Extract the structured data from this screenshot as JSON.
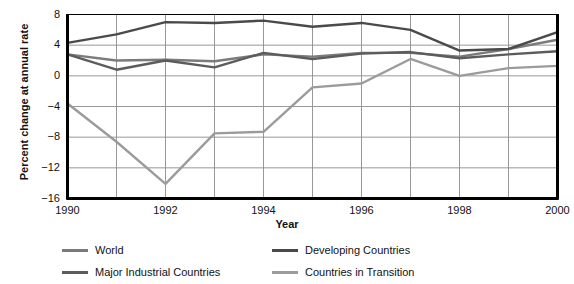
{
  "chart_data": {
    "type": "line",
    "title": "",
    "xlabel": "Year",
    "ylabel": "Percent change at annual rate",
    "x": [
      1990,
      1991,
      1992,
      1993,
      1994,
      1995,
      1996,
      1997,
      1998,
      1999,
      2000
    ],
    "xlim": [
      1990,
      2000
    ],
    "ylim": [
      -16,
      8
    ],
    "yticks": [
      8,
      4,
      0,
      -4,
      -8,
      -12,
      -16
    ],
    "ytick_labels": [
      "8",
      "4",
      "0",
      "−4",
      "−8",
      "−12",
      "−16"
    ],
    "xticks": [
      1990,
      1992,
      1994,
      1996,
      1998,
      2000
    ],
    "xtick_labels": [
      "1990",
      "1992",
      "1994",
      "1996",
      "1998",
      "2000"
    ],
    "grid": true,
    "grid_color": "#8c8c8c",
    "axis_color": "#000000",
    "legend_position": "below",
    "series": [
      {
        "name": "World",
        "color": "#7b7b7b",
        "values": [
          2.8,
          2.0,
          2.1,
          1.9,
          2.8,
          2.5,
          3.0,
          3.0,
          2.5,
          3.5,
          4.7
        ]
      },
      {
        "name": "Developing Countries",
        "color": "#4a4a4a",
        "values": [
          4.3,
          5.4,
          7.0,
          6.9,
          7.2,
          6.4,
          6.9,
          6.0,
          3.3,
          3.5,
          5.7
        ]
      },
      {
        "name": "Major Industrial Countries",
        "color": "#5c5c5c",
        "values": [
          2.8,
          0.8,
          2.0,
          1.1,
          3.0,
          2.2,
          2.9,
          3.1,
          2.3,
          2.8,
          3.2
        ]
      },
      {
        "name": "Countries in Transition",
        "color": "#9b9b9b",
        "values": [
          -3.6,
          -8.6,
          -14.1,
          -7.5,
          -7.3,
          -1.5,
          -1.0,
          2.2,
          0.0,
          1.0,
          1.3
        ]
      }
    ]
  },
  "legend": {
    "items": [
      {
        "label": "World",
        "color": "#7b7b7b"
      },
      {
        "label": "Developing Countries",
        "color": "#4a4a4a"
      },
      {
        "label": "Major Industrial Countries",
        "color": "#5c5c5c"
      },
      {
        "label": "Countries in Transition",
        "color": "#9b9b9b"
      }
    ]
  }
}
